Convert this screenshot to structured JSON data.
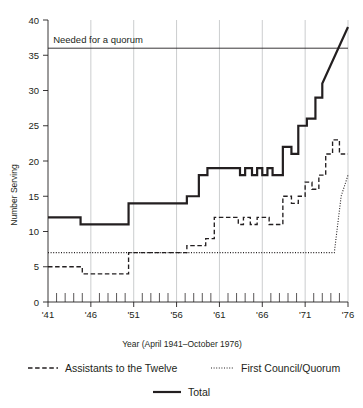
{
  "chart_data": {
    "type": "line",
    "title": "",
    "xlabel": "Year (April 1941–October 1976)",
    "ylabel": "Number Serving",
    "xlim": [
      1941,
      1976
    ],
    "ylim": [
      0,
      40
    ],
    "yticks": [
      0,
      5,
      10,
      15,
      20,
      25,
      30,
      35,
      40
    ],
    "xticks": [
      1941,
      1946,
      1951,
      1956,
      1961,
      1966,
      1971,
      1976
    ],
    "xtick_labels": [
      "'41",
      "'46",
      "'51",
      "'56",
      "'61",
      "'66",
      "'71",
      "'76"
    ],
    "ytick_labels": [
      "0",
      "5",
      "10",
      "15",
      "20",
      "25",
      "30",
      "35",
      "40"
    ],
    "grid": "vertical-major-only",
    "legend_position": "below-axes",
    "annotations": [
      {
        "text": "Needed for a quorum",
        "value": 36,
        "x": 1941.6,
        "style": "horizontal-threshold-line"
      }
    ],
    "series": [
      {
        "name": "Assistants to the Twelve",
        "style": "dashed",
        "color": "#231f20",
        "x": [
          1941,
          1945,
          1945,
          1950.4,
          1950.4,
          1957.2,
          1957.2,
          1958.6,
          1958.6,
          1959.4,
          1959.4,
          1960.4,
          1960.4,
          1963.2,
          1963.2,
          1963.8,
          1963.8,
          1964.6,
          1964.6,
          1965.4,
          1965.4,
          1966.0,
          1966.0,
          1966.8,
          1966.8,
          1967.6,
          1967.6,
          1968.4,
          1968.4,
          1969.4,
          1969.4,
          1970.2,
          1970.2,
          1971.0,
          1971.0,
          1971.8,
          1971.8,
          1972.6,
          1972.6,
          1973.4,
          1973.4,
          1974.2,
          1974.2,
          1975.0,
          1975.0,
          1976
        ],
        "y": [
          5,
          5,
          4,
          4,
          7,
          7,
          8,
          8,
          8,
          8,
          9,
          9,
          12,
          12,
          11,
          11,
          12,
          12,
          11,
          11,
          12,
          12,
          12,
          12,
          11,
          11,
          11,
          11,
          15,
          15,
          14,
          14,
          15,
          15,
          17,
          17,
          16,
          16,
          18,
          18,
          21,
          21,
          23,
          23,
          21,
          21
        ]
      },
      {
        "name": "First Council/Quorum",
        "style": "dotted",
        "color": "#231f20",
        "x": [
          1941,
          1950.4,
          1950.4,
          1974.4,
          1974.4,
          1975.2,
          1975.2,
          1976
        ],
        "y": [
          7,
          7,
          7,
          7,
          7,
          15,
          15,
          18
        ]
      },
      {
        "name": "Total",
        "style": "solid",
        "color": "#231f20",
        "x": [
          1941,
          1944.8,
          1944.8,
          1950.4,
          1950.4,
          1957.2,
          1957.2,
          1958.6,
          1958.6,
          1959.6,
          1959.6,
          1960.6,
          1960.6,
          1963.4,
          1963.4,
          1964.0,
          1964.0,
          1964.8,
          1964.8,
          1965.4,
          1965.4,
          1966.0,
          1966.0,
          1966.6,
          1966.6,
          1967.2,
          1967.2,
          1968.4,
          1968.4,
          1969.4,
          1969.4,
          1970.2,
          1970.2,
          1971.2,
          1971.2,
          1972.2,
          1972.2,
          1973.0,
          1973.0,
          1976
        ],
        "y": [
          12,
          12,
          11,
          11,
          14,
          14,
          15,
          15,
          18,
          18,
          19,
          19,
          19,
          19,
          18,
          18,
          19,
          19,
          18,
          18,
          19,
          19,
          18,
          18,
          19,
          19,
          18,
          18,
          22,
          22,
          21,
          21,
          25,
          25,
          26,
          26,
          29,
          29,
          31,
          39
        ]
      }
    ]
  },
  "legend": {
    "items": [
      {
        "label": "Assistants to the Twelve",
        "style": "dashed"
      },
      {
        "label": "First Council/Quorum",
        "style": "dotted"
      },
      {
        "label": "Total",
        "style": "solid"
      }
    ]
  },
  "axes": {
    "y_title": "Number Serving",
    "x_title": "Year (April 1941–October 1976)"
  },
  "colors": {
    "ink": "#231f20",
    "grid": "#b9bcbe",
    "background": "#ffffff"
  }
}
